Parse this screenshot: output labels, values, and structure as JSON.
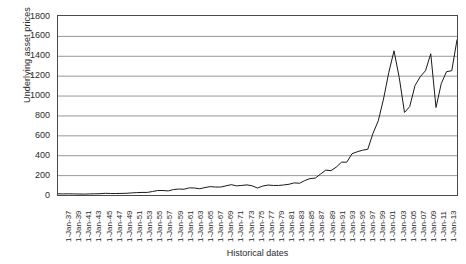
{
  "chart_data": {
    "type": "line",
    "title": "",
    "xlabel": "Historical dates",
    "ylabel": "Underlying asset prices",
    "ylim": [
      0,
      1800
    ],
    "ytick_step": 200,
    "yticks": [
      1800,
      1600,
      1400,
      1200,
      1000,
      800,
      600,
      400,
      200,
      0
    ],
    "grid": true,
    "grid_axis": "y",
    "legend": "none",
    "line_color": "#1a1a1a",
    "line_width": 1,
    "xtick_labels": [
      "1-Jan-37",
      "1-Jan-39",
      "1-Jan-41",
      "1-Jan-43",
      "1-Jan-45",
      "1-Jan-47",
      "1-Jan-49",
      "1-Jan-51",
      "1-Jan-53",
      "1-Jan-55",
      "1-Jan-57",
      "1-Jan-59",
      "1-Jan-61",
      "1-Jan-63",
      "1-Jan-65",
      "1-Jan-67",
      "1-Jan-69",
      "1-Jan-71",
      "1-Jan-73",
      "1-Jan-75",
      "1-Jan-77",
      "1-Jan-79",
      "1-Jan-81",
      "1-Jan-83",
      "1-Jan-85",
      "1-Jan-87",
      "1-Jan-89",
      "1-Jan-91",
      "1-Jan-93",
      "1-Jan-95",
      "1-Jan-97",
      "1-Jan-99",
      "1-Jan-01",
      "1-Jan-03",
      "1-Jan-05",
      "1-Jan-07",
      "1-Jan-09",
      "1-Jan-11",
      "1-Jan-13"
    ],
    "x": [
      1937,
      1938,
      1939,
      1940,
      1941,
      1942,
      1943,
      1944,
      1945,
      1946,
      1947,
      1948,
      1949,
      1950,
      1951,
      1952,
      1953,
      1954,
      1955,
      1956,
      1957,
      1958,
      1959,
      1960,
      1961,
      1962,
      1963,
      1964,
      1965,
      1966,
      1967,
      1968,
      1969,
      1970,
      1971,
      1972,
      1973,
      1974,
      1975,
      1976,
      1977,
      1978,
      1979,
      1980,
      1981,
      1982,
      1983,
      1984,
      1985,
      1986,
      1987,
      1988,
      1989,
      1990,
      1991,
      1992,
      1993,
      1994,
      1995,
      1996,
      1997,
      1998,
      1999,
      2000,
      2001,
      2002,
      2003,
      2004,
      2005,
      2006,
      2007,
      2008,
      2009,
      2010,
      2011,
      2012,
      2013
    ],
    "values": [
      12,
      11,
      12,
      11,
      10,
      9,
      11,
      12,
      13,
      17,
      15,
      15,
      16,
      17,
      21,
      24,
      26,
      26,
      35,
      45,
      45,
      41,
      55,
      60,
      58,
      72,
      70,
      63,
      75,
      84,
      80,
      80,
      92,
      104,
      92,
      96,
      102,
      92,
      70,
      90,
      100,
      96,
      96,
      101,
      108,
      122,
      118,
      145,
      165,
      170,
      210,
      250,
      245,
      280,
      330,
      330,
      415,
      435,
      450,
      460,
      620,
      745,
      965,
      1230,
      1450,
      1180,
      830,
      890,
      1100,
      1190,
      1250,
      1420,
      880,
      1120,
      1240,
      1250,
      1560
    ]
  }
}
